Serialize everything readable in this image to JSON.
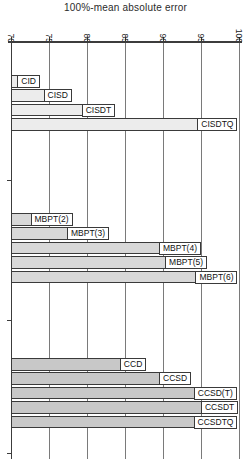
{
  "chart_data": {
    "type": "bar",
    "orientation": "horizontal",
    "title": "100%-mean absolute error",
    "axis": {
      "position": "top",
      "min": 70,
      "max": 100,
      "ticks": [
        70,
        75,
        80,
        85,
        90,
        95,
        100
      ],
      "tick_label_rotation_deg": 90
    },
    "grid": true,
    "legend": "none",
    "groups": [
      {
        "color": "#ececec",
        "bars": [
          {
            "label": "CID",
            "value": 73.8,
            "label_inside": true
          },
          {
            "label": "CISD",
            "value": 78.0,
            "label_inside": true
          },
          {
            "label": "CISDT",
            "value": 83.7,
            "label_inside": true
          },
          {
            "label": "CISDTQ",
            "value": 99.8,
            "label_inside": true
          }
        ]
      },
      {
        "color": "#d8d8d8",
        "bars": [
          {
            "label": "MBPT(2)",
            "value": 72.7,
            "label_inside": false
          },
          {
            "label": "MBPT(3)",
            "value": 77.5,
            "label_inside": false
          },
          {
            "label": "MBPT(4)",
            "value": 95.0,
            "label_inside": true
          },
          {
            "label": "MBPT(5)",
            "value": 95.8,
            "label_inside": true
          },
          {
            "label": "MBPT(6)",
            "value": 99.8,
            "label_inside": true
          }
        ]
      },
      {
        "color": "#c8c8c8",
        "bars": [
          {
            "label": "CCD",
            "value": 87.8,
            "label_inside": true
          },
          {
            "label": "CCSD",
            "value": 93.7,
            "label_inside": true
          },
          {
            "label": "CCSD(T)",
            "value": 99.7,
            "label_inside": true
          },
          {
            "label": "CCSDT",
            "value": 99.9,
            "label_inside": true
          },
          {
            "label": "CCSDTQ",
            "value": 99.8,
            "label_inside": true
          }
        ]
      }
    ]
  }
}
